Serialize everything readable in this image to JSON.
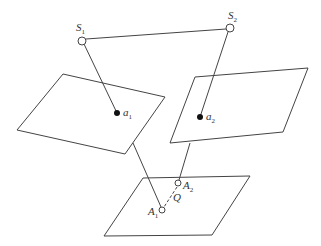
{
  "diagram": {
    "stroke_color": "#444444",
    "labels": {
      "s1": {
        "main": "S",
        "sub": "1"
      },
      "s2": {
        "main": "S",
        "sub": "2"
      },
      "a1": {
        "main": "a",
        "sub": "1"
      },
      "a2": {
        "main": "a",
        "sub": "2"
      },
      "A1": {
        "main": "A",
        "sub": "1"
      },
      "A2": {
        "main": "A",
        "sub": "2"
      },
      "Q": {
        "main": "Q"
      }
    }
  }
}
